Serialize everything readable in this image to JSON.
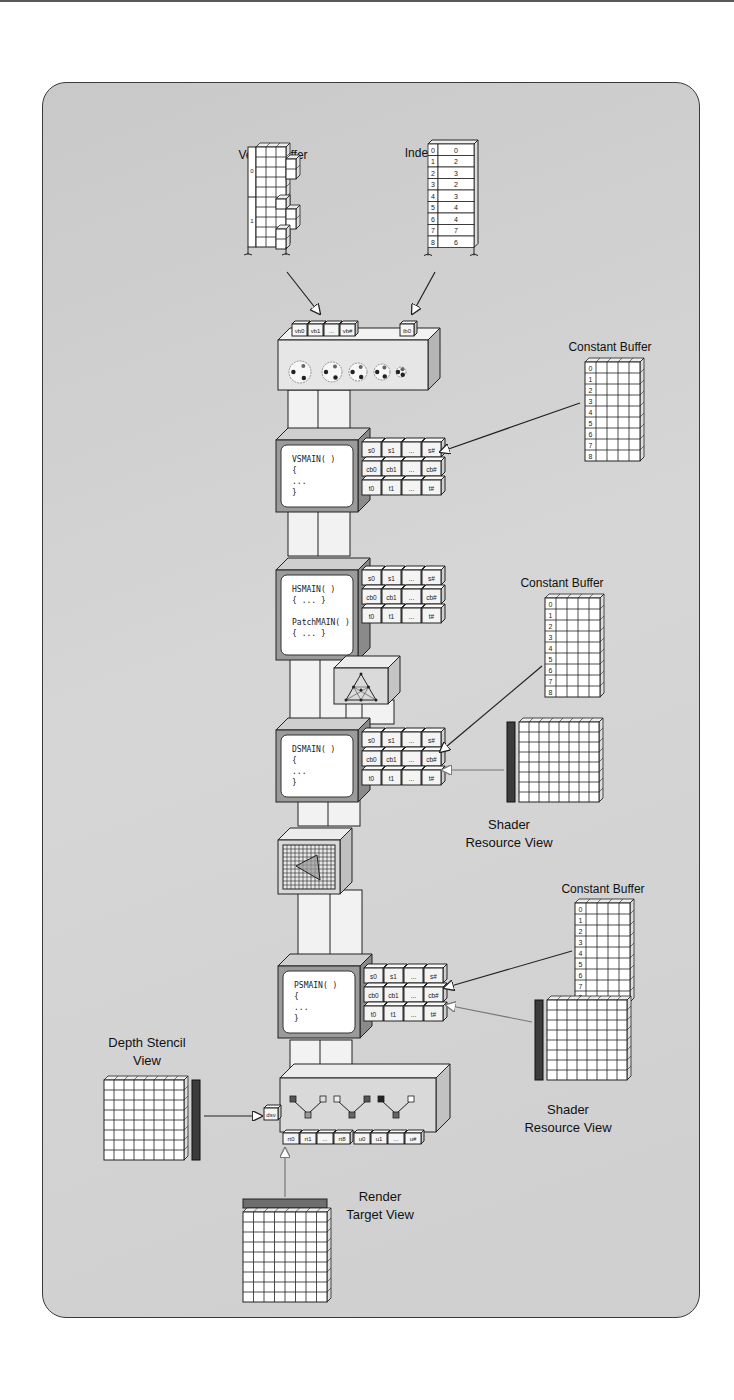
{
  "figure": {
    "colors": {
      "panel_bg": "#d0d0d0",
      "panel_border": "#3a3a3a",
      "stage_face": "#e6e6e6",
      "stage_side": "#b5b5b5",
      "screen": "#ffffff",
      "srv_bar": "#3c3c3c",
      "rtv_bar": "#6e6e6e"
    }
  },
  "vertex_buffer": {
    "label": "Vertex Buffer",
    "row_labels": [
      "0",
      "1"
    ]
  },
  "index_buffer": {
    "label": "Index Buffer",
    "rows": [
      {
        "i": "0",
        "v": "0"
      },
      {
        "i": "1",
        "v": "2"
      },
      {
        "i": "2",
        "v": "3"
      },
      {
        "i": "3",
        "v": "2"
      },
      {
        "i": "4",
        "v": "3"
      },
      {
        "i": "5",
        "v": "4"
      },
      {
        "i": "6",
        "v": "4"
      },
      {
        "i": "7",
        "v": "7"
      },
      {
        "i": "8",
        "v": "6"
      }
    ]
  },
  "input_assembler": {
    "slots": [
      "vb0",
      "vb1",
      "...",
      "vb#"
    ],
    "index_slot": "ib0"
  },
  "constant_buffers": [
    {
      "label": "Constant Buffer",
      "rows": [
        "0",
        "1",
        "2",
        "3",
        "4",
        "5",
        "6",
        "7",
        "8"
      ]
    },
    {
      "label": "Constant Buffer",
      "rows": [
        "0",
        "1",
        "2",
        "3",
        "4",
        "5",
        "6",
        "7",
        "8"
      ]
    },
    {
      "label": "Constant Buffer",
      "rows": [
        "0",
        "1",
        "2",
        "3",
        "4",
        "5",
        "6",
        "7",
        "8"
      ]
    }
  ],
  "resource_slots": {
    "samplers": [
      "s0",
      "s1",
      "...",
      "s#"
    ],
    "cbuffers": [
      "cb0",
      "cb1",
      "...",
      "cb#"
    ],
    "textures": [
      "t0",
      "t1",
      "...",
      "t#"
    ]
  },
  "stages": {
    "vs": {
      "lines": [
        "VSMAIN(  )",
        "{",
        "  ...",
        "}"
      ]
    },
    "hs": {
      "lines": [
        "HSMAIN(  )",
        "{ ... }",
        "",
        "PatchMAIN( )",
        "{ ... }"
      ]
    },
    "ds": {
      "lines": [
        "DSMAIN(  )",
        "{",
        "  ...",
        "}"
      ]
    },
    "ps": {
      "lines": [
        "PSMAIN(  )",
        "{",
        "  ...",
        "}"
      ]
    }
  },
  "shader_resource_views": [
    {
      "label_line1": "Shader",
      "label_line2": "Resource View"
    },
    {
      "label_line1": "Shader",
      "label_line2": "Resource View"
    }
  ],
  "depth_stencil_view": {
    "label_line1": "Depth Stencil",
    "label_line2": "View",
    "slot": "dsv"
  },
  "render_target_view": {
    "label_line1": "Render",
    "label_line2": "Target View"
  },
  "output_merger": {
    "rt_slots": [
      "rt0",
      "rt1",
      "...",
      "rt8"
    ],
    "uav_slots": [
      "u0",
      "u1",
      "...",
      "u#"
    ]
  }
}
